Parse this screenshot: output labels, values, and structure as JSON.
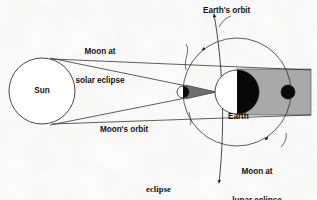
{
  "figure": {
    "caption": "eclipse",
    "bodies": {
      "sun": {
        "label": "Sun",
        "cx": 42,
        "cy": 91,
        "r": 33,
        "fill": "#ffffff",
        "stroke": "#2a2a2a"
      },
      "earth": {
        "label": "Earth",
        "cx": 237,
        "cy": 92,
        "r": 22,
        "fill": "#ffffff",
        "night_fill": "#080808"
      },
      "moon_solar": {
        "label": "Moon at\nsolar eclipse",
        "cx": 183,
        "cy": 92,
        "r": 6,
        "fill": "#ffffff",
        "night_fill": "#080808"
      },
      "moon_lunar": {
        "label": "Moon at\nlunar eclipse",
        "cx": 288,
        "cy": 92,
        "r": 7,
        "fill": "#080808"
      }
    },
    "orbits": {
      "moon_orbit": {
        "label": "Moon's orbit",
        "cx": 237,
        "cy": 92,
        "r": 54,
        "stroke": "#2a2a2a"
      },
      "earth_orbit": {
        "label": "Earth's orbit",
        "stroke": "#2a2a2a"
      }
    },
    "shadow": {
      "umbra_fill": "#a9a9a9",
      "moon_shadow_fill": "#6e6e6e"
    },
    "labels": [
      {
        "id": "moon-solar-label",
        "line1": "Moon at",
        "line2": "solar eclipse",
        "x": 100,
        "y": 32
      },
      {
        "id": "earth-orbit-label",
        "line1": "Earth's orbit",
        "line2": "",
        "x": 233,
        "y": 9
      },
      {
        "id": "moons-orbit-label",
        "line1": "Moon's orbit",
        "line2": "",
        "x": 136,
        "y": 128
      },
      {
        "id": "earth-label",
        "line1": "Earth",
        "line2": "",
        "x": 232,
        "y": 116
      },
      {
        "id": "moon-lunar-label",
        "line1": "Moon at",
        "line2": "lunar eclipse",
        "x": 257,
        "y": 152
      },
      {
        "id": "sun-label",
        "line1": "Sun",
        "line2": "",
        "x": 42,
        "y": 87
      }
    ]
  }
}
